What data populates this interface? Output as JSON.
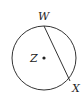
{
  "diagram": {
    "type": "circle-with-chord",
    "circle": {
      "center_label": "Z",
      "cx": 44,
      "cy": 58,
      "r": 32
    },
    "chord": {
      "from": "W",
      "to": "X"
    },
    "points": [
      {
        "label": "W",
        "x": 44,
        "y": 26
      },
      {
        "label": "X",
        "x": 70,
        "y": 81
      }
    ],
    "labels": {
      "W": "W",
      "X": "X",
      "Z": "Z"
    },
    "colors": {
      "stroke": "#333333",
      "text": "#222222",
      "background": "#ffffff"
    }
  }
}
